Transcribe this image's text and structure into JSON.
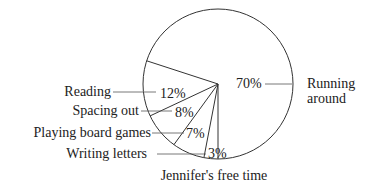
{
  "chart_data": {
    "type": "pie",
    "title": "Jennifer's free time",
    "categories": [
      "Running around",
      "Reading",
      "Spacing out",
      "Playing board games",
      "Writing letters"
    ],
    "values": [
      70,
      12,
      8,
      7,
      3
    ],
    "unit": "%",
    "labels": [
      {
        "name": "Running around",
        "line1": "Running",
        "line2": "around",
        "pct": "70%"
      },
      {
        "name": "Reading",
        "line1": "Reading",
        "pct": "12%"
      },
      {
        "name": "Spacing out",
        "line1": "Spacing out",
        "pct": "8%"
      },
      {
        "name": "Playing board games",
        "line1": "Playing board games",
        "pct": "7%"
      },
      {
        "name": "Writing letters",
        "line1": "Writing letters",
        "pct": "3%"
      }
    ],
    "colors": {
      "stroke": "#333333",
      "fill": "#ffffff",
      "text": "#222222"
    }
  }
}
